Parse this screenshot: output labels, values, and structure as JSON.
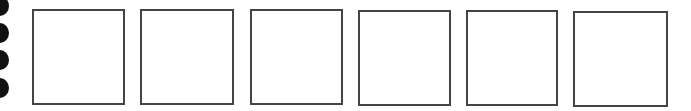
{
  "page": {
    "background": "#ffffff",
    "border_color": "#444444",
    "hole_color": "#111111"
  },
  "binding_holes": [
    {
      "top": 0
    },
    {
      "top": 27
    },
    {
      "top": 54
    },
    {
      "top": 82
    }
  ],
  "boxes": [
    {
      "left": 32,
      "top": 9,
      "width": 93,
      "height": 96
    },
    {
      "left": 140,
      "top": 9,
      "width": 94,
      "height": 96
    },
    {
      "left": 250,
      "top": 9,
      "width": 93,
      "height": 96
    },
    {
      "left": 358,
      "top": 10,
      "width": 93,
      "height": 96
    },
    {
      "left": 466,
      "top": 10,
      "width": 92,
      "height": 96
    },
    {
      "left": 573,
      "top": 11,
      "width": 95,
      "height": 96
    }
  ]
}
